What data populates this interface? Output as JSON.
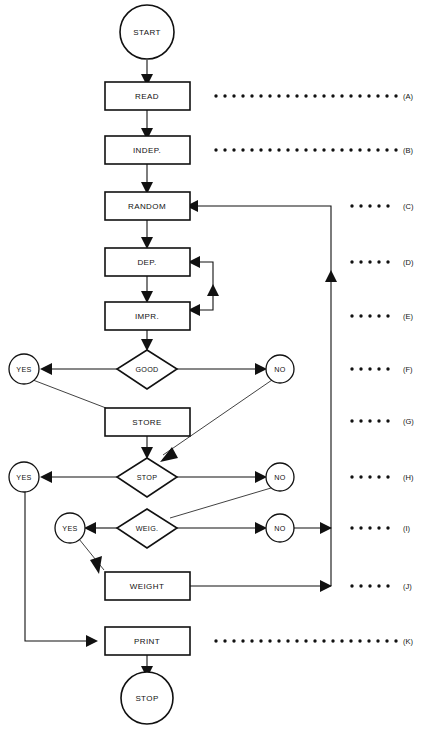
{
  "diagram": {
    "background_color": "#ffffff",
    "line_color": "#111111",
    "width": 423,
    "height": 729
  },
  "nodes": {
    "start": {
      "label": "START",
      "shape": "circle"
    },
    "read": {
      "label": "READ",
      "shape": "rectangle"
    },
    "indep": {
      "label": "INDEP.",
      "shape": "rectangle"
    },
    "random": {
      "label": "RANDOM",
      "shape": "rectangle"
    },
    "dep": {
      "label": "DEP.",
      "shape": "rectangle"
    },
    "impr": {
      "label": "IMPR.",
      "shape": "rectangle"
    },
    "good": {
      "label": "GOOD",
      "shape": "diamond"
    },
    "good_yes": {
      "label": "YES",
      "shape": "circle"
    },
    "good_no": {
      "label": "NO",
      "shape": "circle"
    },
    "store": {
      "label": "STORE",
      "shape": "rectangle"
    },
    "stop_decision": {
      "label": "STOP",
      "shape": "diamond"
    },
    "stop_yes": {
      "label": "YES",
      "shape": "circle"
    },
    "stop_no": {
      "label": "NO",
      "shape": "circle"
    },
    "weig": {
      "label": "WEIG.",
      "shape": "diamond"
    },
    "weig_yes": {
      "label": "YES",
      "shape": "circle"
    },
    "weig_no": {
      "label": "NO",
      "shape": "circle"
    },
    "weight": {
      "label": "WEIGHT",
      "shape": "rectangle"
    },
    "print": {
      "label": "PRINT",
      "shape": "rectangle"
    },
    "stop_terminal": {
      "label": "STOP",
      "shape": "circle"
    }
  },
  "reference_labels": [
    {
      "id": "A",
      "label": "(A)",
      "row_y": 96,
      "dots": 21,
      "dot_start_x": 216,
      "dot_spacing": 9
    },
    {
      "id": "B",
      "label": "(B)",
      "row_y": 150,
      "dots": 21,
      "dot_start_x": 216,
      "dot_spacing": 9
    },
    {
      "id": "C",
      "label": "(C)",
      "row_y": 206,
      "dots": 5,
      "dot_start_x": 352,
      "dot_spacing": 9
    },
    {
      "id": "D",
      "label": "(D)",
      "row_y": 262,
      "dots": 5,
      "dot_start_x": 352,
      "dot_spacing": 9
    },
    {
      "id": "E",
      "label": "(E)",
      "row_y": 316,
      "dots": 5,
      "dot_start_x": 352,
      "dot_spacing": 9
    },
    {
      "id": "F",
      "label": "(F)",
      "row_y": 369,
      "dots": 5,
      "dot_start_x": 352,
      "dot_spacing": 9
    },
    {
      "id": "G",
      "label": "(G)",
      "row_y": 421,
      "dots": 5,
      "dot_start_x": 352,
      "dot_spacing": 9
    },
    {
      "id": "H",
      "label": "(H)",
      "row_y": 477,
      "dots": 5,
      "dot_start_x": 352,
      "dot_spacing": 9
    },
    {
      "id": "I",
      "label": "(I)",
      "row_y": 528,
      "dots": 5,
      "dot_start_x": 352,
      "dot_spacing": 9
    },
    {
      "id": "J",
      "label": "(J)",
      "row_y": 586,
      "dots": 5,
      "dot_start_x": 352,
      "dot_spacing": 9
    },
    {
      "id": "K",
      "label": "(K)",
      "row_y": 641,
      "dots": 21,
      "dot_start_x": 216,
      "dot_spacing": 9
    }
  ]
}
